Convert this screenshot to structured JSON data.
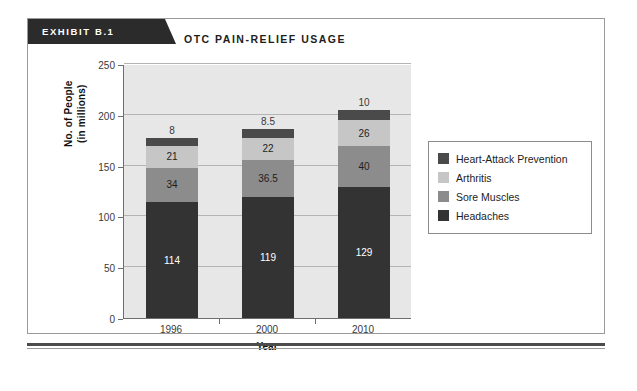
{
  "exhibit": {
    "banner_label": "EXHIBIT B.1",
    "title": "OTC PAIN-RELIEF USAGE"
  },
  "colors": {
    "heart_attack_prevention": "#4a4a4a",
    "arthritis": "#c6c6c6",
    "sore_muscles": "#8c8c8c",
    "headaches": "#333333",
    "plot_background": "#e7e7e7",
    "gridline": "#b4b4b4",
    "axis": "#6e6e6e",
    "banner_background": "#2b2b2b"
  },
  "chart_data": {
    "type": "bar",
    "title": "OTC PAIN-RELIEF USAGE",
    "subtitle": "",
    "stacked": true,
    "xlabel": "Year",
    "ylabel": "No. of People (in millions)",
    "ylabel_line1": "No. of People",
    "ylabel_line2": "(in millions)",
    "categories": [
      "1996",
      "2000",
      "2010"
    ],
    "ylim": [
      0,
      250
    ],
    "yticks": [
      0,
      50,
      100,
      150,
      200,
      250
    ],
    "ytick_labels": [
      "0",
      "50",
      "100",
      "150",
      "200",
      "250"
    ],
    "grid": true,
    "legend_position": "right",
    "series": [
      {
        "name": "Headaches",
        "color": "#333333",
        "values": [
          114,
          119,
          129
        ],
        "labels": [
          "114",
          "119",
          "129"
        ],
        "label_color": "#ffffff"
      },
      {
        "name": "Sore Muscles",
        "color": "#8c8c8c",
        "values": [
          34,
          36.5,
          40
        ],
        "labels": [
          "34",
          "36.5",
          "40"
        ],
        "label_color": "#1d1d1d"
      },
      {
        "name": "Arthritis",
        "color": "#c6c6c6",
        "values": [
          21,
          22,
          26
        ],
        "labels": [
          "21",
          "22",
          "26"
        ],
        "label_color": "#1d1d1d"
      },
      {
        "name": "Heart-Attack Prevention",
        "color": "#4a4a4a",
        "values": [
          8,
          8.5,
          10
        ],
        "labels": [
          "8",
          "8.5",
          "10"
        ],
        "label_color": "#3a3a3a",
        "labels_outside": true
      }
    ],
    "totals": [
      177,
      186,
      205
    ]
  },
  "legend": {
    "entries": [
      {
        "label": "Heart-Attack Prevention",
        "color": "#4a4a4a"
      },
      {
        "label": "Arthritis",
        "color": "#c6c6c6"
      },
      {
        "label": "Sore Muscles",
        "color": "#8c8c8c"
      },
      {
        "label": "Headaches",
        "color": "#333333"
      }
    ]
  }
}
